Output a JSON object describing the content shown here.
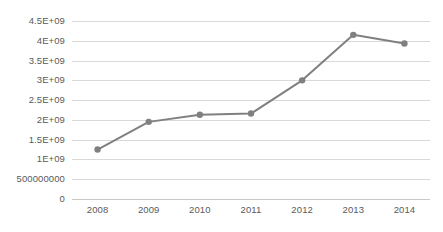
{
  "chart_data": {
    "type": "line",
    "title": "",
    "subtitle": "",
    "xlabel": "",
    "ylabel": "",
    "categories": [
      "2008",
      "2009",
      "2010",
      "2011",
      "2012",
      "2013",
      "2014"
    ],
    "x": [
      2008,
      2009,
      2010,
      2011,
      2012,
      2013,
      2014
    ],
    "series": [
      {
        "name": "",
        "values": [
          1250000000,
          1950000000,
          2130000000,
          2160000000,
          3000000000,
          4150000000,
          3930000000
        ],
        "color": "#808080",
        "marker": "circle",
        "marker_color": "#808080",
        "line_width": 2
      }
    ],
    "ylim": [
      0,
      4500000000
    ],
    "yticks": [
      0,
      500000000,
      1000000000,
      1500000000,
      2000000000,
      2500000000,
      3000000000,
      3500000000,
      4000000000,
      4500000000
    ],
    "ytick_labels": [
      "0",
      "500000000",
      "1E+09",
      "1.5E+09",
      "2E+09",
      "2.5E+09",
      "3E+09",
      "3.5E+09",
      "4E+09",
      "4.5E+09"
    ],
    "xtick_labels": [
      "2008",
      "2009",
      "2010",
      "2011",
      "2012",
      "2013",
      "2014"
    ],
    "grid": {
      "horizontal": true,
      "vertical": false,
      "color": "#d9d9d9"
    },
    "legend": {
      "visible": false,
      "position": "none",
      "entries": []
    },
    "annotations": [],
    "background_color": "#ffffff",
    "axis_color": "#c9c9c9",
    "tick_label_color": "#5a5a5a"
  }
}
